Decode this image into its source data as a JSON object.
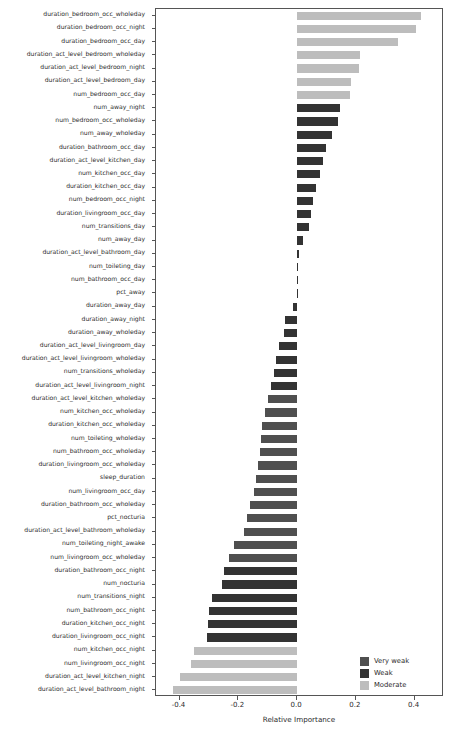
{
  "chart_data": {
    "type": "bar",
    "orientation": "horizontal",
    "title": "",
    "xlabel": "Relative Importance",
    "ylabel": "",
    "xlim": [
      -0.48,
      0.5
    ],
    "xticks": [
      -0.4,
      -0.2,
      0.0,
      0.2,
      0.4
    ],
    "xticklabels": [
      "-0.4",
      "-0.2",
      "0.0",
      "0.2",
      "0.4"
    ],
    "grid": false,
    "legend_position": "lower right",
    "legend": [
      {
        "label": "Very weak",
        "color": "#4f4f4f"
      },
      {
        "label": "Weak",
        "color": "#333333"
      },
      {
        "label": "Moderate",
        "color": "#bdbdbd"
      }
    ],
    "categories": [
      "duration_bedroom_occ_wholeday",
      "duration_bedroom_occ_night",
      "duration_bedroom_occ_day",
      "duration_act_level_bedroom_wholeday",
      "duration_act_level_bedroom_night",
      "duration_act_level_bedroom_day",
      "num_bedroom_occ_day",
      "num_away_night",
      "num_bedroom_occ_wholeday",
      "num_away_wholeday",
      "duration_bathroom_occ_day",
      "duration_act_level_kitchen_day",
      "num_kitchen_occ_day",
      "duration_kitchen_occ_day",
      "num_bedroom_occ_night",
      "duration_livingroom_occ_day",
      "num_transitions_day",
      "num_away_day",
      "duration_act_level_bathroom_day",
      "num_toileting_day",
      "num_bathroom_occ_day",
      "pct_away",
      "duration_away_day",
      "duration_away_night",
      "duration_away_wholeday",
      "duration_act_level_livingroom_day",
      "duration_act_level_livingroom_wholeday",
      "num_transitions_wholeday",
      "duration_act_level_livingroom_night",
      "duration_act_level_kitchen_wholeday",
      "num_kitchen_occ_wholeday",
      "duration_kitchen_occ_wholeday",
      "num_toileting_wholeday",
      "num_bathroom_occ_wholeday",
      "duration_livingroom_occ_wholeday",
      "sleep_duration",
      "num_livingroom_occ_day",
      "duration_bathroom_occ_wholeday",
      "pct_nocturia",
      "duration_act_level_bathroom_wholeday",
      "num_toileting_night_awake",
      "num_livingroom_occ_wholeday",
      "duration_bathroom_occ_night",
      "num_nocturia",
      "num_transitions_night",
      "num_bathroom_occ_night",
      "duration_kitchen_occ_night",
      "duration_livingroom_occ_night",
      "num_kitchen_occ_night",
      "num_livingroom_occ_night",
      "duration_act_level_kitchen_night",
      "duration_act_level_bathroom_night"
    ],
    "values": [
      0.423,
      0.405,
      0.343,
      0.213,
      0.21,
      0.185,
      0.18,
      0.145,
      0.14,
      0.12,
      0.1,
      0.09,
      0.077,
      0.065,
      0.053,
      0.047,
      0.04,
      0.02,
      0.007,
      0.003,
      0.002,
      -0.001,
      -0.013,
      -0.04,
      -0.043,
      -0.063,
      -0.07,
      -0.08,
      -0.09,
      -0.1,
      -0.11,
      -0.12,
      -0.122,
      -0.127,
      -0.133,
      -0.14,
      -0.145,
      -0.16,
      -0.17,
      -0.18,
      -0.213,
      -0.233,
      -0.25,
      -0.257,
      -0.29,
      -0.3,
      -0.303,
      -0.307,
      -0.35,
      -0.36,
      -0.4,
      -0.423
    ],
    "bar_classes": [
      "Moderate",
      "Moderate",
      "Moderate",
      "Moderate",
      "Moderate",
      "Moderate",
      "Moderate",
      "Weak",
      "Weak",
      "Weak",
      "Weak",
      "Weak",
      "Weak",
      "Weak",
      "Weak",
      "Weak",
      "Weak",
      "Weak",
      "Weak",
      "Weak",
      "Weak",
      "Weak",
      "Weak",
      "Weak",
      "Weak",
      "Weak",
      "Weak",
      "Weak",
      "Weak",
      "Very weak",
      "Very weak",
      "Very weak",
      "Very weak",
      "Very weak",
      "Very weak",
      "Very weak",
      "Very weak",
      "Very weak",
      "Very weak",
      "Very weak",
      "Very weak",
      "Very weak",
      "Weak",
      "Weak",
      "Weak",
      "Weak",
      "Weak",
      "Weak",
      "Moderate",
      "Moderate",
      "Moderate",
      "Moderate"
    ]
  },
  "colors": {
    "very_weak": "#4f4f4f",
    "weak": "#333333",
    "moderate": "#bdbdbd",
    "axis": "#555555",
    "text": "#2b2b2b",
    "background": "#ffffff"
  }
}
